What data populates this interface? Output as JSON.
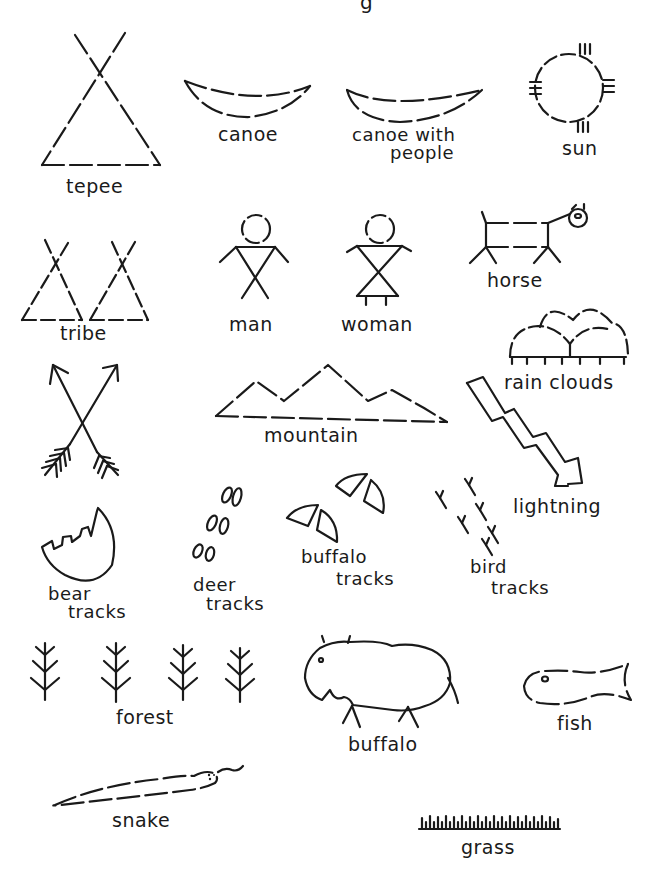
{
  "page": {
    "title_fragment": "g",
    "background": "#ffffff",
    "ink_color": "#1a1a1a"
  },
  "symbols": {
    "tepee": {
      "label": "tepee"
    },
    "canoe": {
      "label": "canoe"
    },
    "canoe_with_people": {
      "label_line1": "canoe with",
      "label_line2": "people"
    },
    "sun": {
      "label": "sun"
    },
    "tribe": {
      "label": "tribe"
    },
    "man": {
      "label": "man"
    },
    "woman": {
      "label": "woman"
    },
    "horse": {
      "label": "horse"
    },
    "rain_clouds": {
      "label": "rain clouds"
    },
    "arrows": {
      "label": ""
    },
    "mountain": {
      "label": "mountain"
    },
    "lightning": {
      "label": "lightning"
    },
    "bear_tracks": {
      "label_line1": "bear",
      "label_line2": "tracks"
    },
    "deer_tracks": {
      "label_line1": "deer",
      "label_line2": "tracks"
    },
    "buffalo_tracks": {
      "label_line1": "buffalo",
      "label_line2": "tracks"
    },
    "bird_tracks": {
      "label_line1": "bird",
      "label_line2": "tracks"
    },
    "forest": {
      "label": "forest"
    },
    "buffalo": {
      "label": "buffalo"
    },
    "fish": {
      "label": "fish"
    },
    "snake": {
      "label": "snake"
    },
    "grass": {
      "label": "grass"
    }
  }
}
